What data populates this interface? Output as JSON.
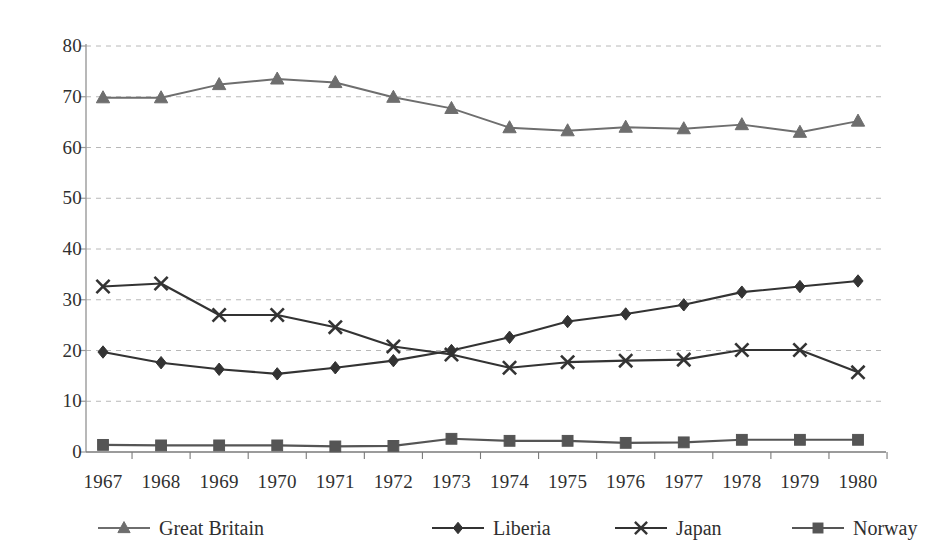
{
  "chart_data": {
    "type": "line",
    "title": "",
    "subtitle": "",
    "xlabel": "",
    "ylabel": "",
    "grid": true,
    "grid_style": "dashed-horizontal",
    "legend_position": "bottom",
    "categories": [
      "1967",
      "1968",
      "1969",
      "1970",
      "1971",
      "1972",
      "1973",
      "1974",
      "1975",
      "1976",
      "1977",
      "1978",
      "1979",
      "1980"
    ],
    "ylim": [
      0,
      80
    ],
    "yticks": [
      0,
      10,
      20,
      30,
      40,
      50,
      60,
      70,
      80
    ],
    "ytick_labels": [
      "0",
      "10",
      "20",
      "30",
      "40",
      "50",
      "60",
      "70",
      "80"
    ],
    "series": [
      {
        "name": "Great Britain",
        "marker": "triangle",
        "color": "#6e6e6e",
        "values": [
          69.8,
          69.8,
          72.4,
          73.5,
          72.8,
          69.9,
          67.7,
          63.9,
          63.3,
          64.0,
          63.7,
          64.5,
          63.0,
          65.2
        ]
      },
      {
        "name": "Liberia",
        "marker": "diamond",
        "color": "#333333",
        "values": [
          19.7,
          17.6,
          16.3,
          15.4,
          16.6,
          18.0,
          20.0,
          22.6,
          25.7,
          27.2,
          29.0,
          31.5,
          32.6,
          33.7
        ]
      },
      {
        "name": "Japan",
        "marker": "x",
        "color": "#333333",
        "values": [
          32.6,
          33.2,
          27.0,
          27.0,
          24.6,
          20.8,
          19.2,
          16.6,
          17.7,
          18.0,
          18.2,
          20.1,
          20.1,
          15.7
        ]
      },
      {
        "name": "Norway",
        "marker": "square",
        "color": "#555555",
        "values": [
          1.4,
          1.3,
          1.3,
          1.3,
          1.1,
          1.2,
          2.6,
          2.2,
          2.2,
          1.8,
          1.9,
          2.4,
          2.4,
          2.4
        ]
      }
    ]
  },
  "legend": {
    "entries": [
      {
        "label": "Great Britain",
        "marker": "triangle",
        "color": "#6e6e6e"
      },
      {
        "label": "Liberia",
        "marker": "diamond",
        "color": "#333333"
      },
      {
        "label": "Japan",
        "marker": "x",
        "color": "#333333"
      },
      {
        "label": "Norway",
        "marker": "square",
        "color": "#555555"
      }
    ]
  },
  "axes": {
    "y_axis_color": "#9a9a9a",
    "x_axis_color": "#7a7a7a",
    "gridline_color": "#b8b8b8"
  }
}
